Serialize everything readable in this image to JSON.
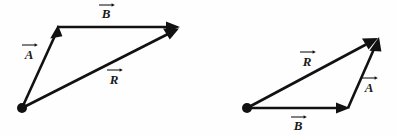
{
  "figure": {
    "background_color": "#fefefe",
    "stroke_color": "#111111",
    "label_color": "#1a1a1a",
    "width": 397,
    "height": 135
  },
  "diagrams": [
    {
      "id": "left-diagram",
      "name": "A-then-B triangle",
      "origin": {
        "x": 22,
        "y": 108
      },
      "vectors": [
        {
          "key": "A",
          "label": "A",
          "name": "vector-a",
          "from": {
            "x": 22,
            "y": 108
          },
          "to": {
            "x": 58,
            "y": 29
          },
          "label_pos": {
            "x": 29,
            "y": 59
          },
          "overbar": {
            "x": 22,
            "y": 45,
            "width": 14
          }
        },
        {
          "key": "B",
          "label": "B",
          "name": "vector-b",
          "from": {
            "x": 58,
            "y": 27
          },
          "to": {
            "x": 178,
            "y": 27
          },
          "label_pos": {
            "x": 106,
            "y": 18
          },
          "overbar": {
            "x": 99,
            "y": 5,
            "width": 14
          }
        },
        {
          "key": "R",
          "label": "R",
          "name": "vector-r",
          "from": {
            "x": 22,
            "y": 108
          },
          "to": {
            "x": 178,
            "y": 29
          },
          "label_pos": {
            "x": 114,
            "y": 84
          },
          "overbar": {
            "x": 107,
            "y": 70,
            "width": 14
          }
        }
      ]
    },
    {
      "id": "right-diagram",
      "name": "B-then-A triangle",
      "origin": {
        "x": 247,
        "y": 108
      },
      "vectors": [
        {
          "key": "R",
          "label": "R",
          "name": "vector-r",
          "from": {
            "x": 247,
            "y": 108
          },
          "to": {
            "x": 378,
            "y": 38
          },
          "label_pos": {
            "x": 307,
            "y": 66
          },
          "overbar": {
            "x": 300,
            "y": 52,
            "width": 14
          }
        },
        {
          "key": "A",
          "label": "A",
          "name": "vector-a",
          "from": {
            "x": 348,
            "y": 108
          },
          "to": {
            "x": 379,
            "y": 40
          },
          "label_pos": {
            "x": 369,
            "y": 92
          },
          "overbar": {
            "x": 362,
            "y": 78,
            "width": 14
          }
        },
        {
          "key": "B",
          "label": "B",
          "name": "vector-b",
          "from": {
            "x": 247,
            "y": 108
          },
          "to": {
            "x": 348,
            "y": 108
          },
          "label_pos": {
            "x": 298,
            "y": 130
          },
          "overbar": {
            "x": 291,
            "y": 117,
            "width": 14
          }
        }
      ]
    }
  ],
  "labels": {
    "a": "A",
    "b": "B",
    "r": "R"
  }
}
